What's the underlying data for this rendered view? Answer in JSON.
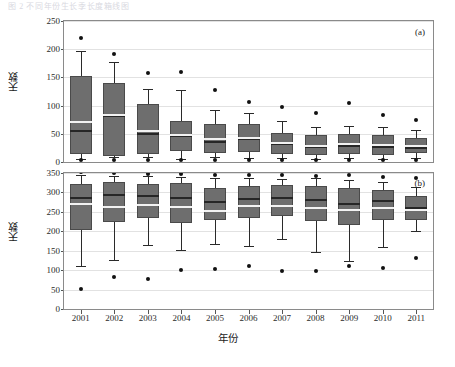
{
  "figure": {
    "caption_strip": "图 2  不同年份生长季长度箱线图",
    "xlabel": "年份",
    "panel_a_tag": "(a)",
    "panel_b_tag": "(b)",
    "box_fill_color": "#6e6e6e",
    "median_color": "#f2f2f2",
    "mean_color": "#262626",
    "outlier_color": "#111111",
    "grid_color": "#e2e2e2",
    "frame_color": "#8a8a8a"
  },
  "chart_data": [
    {
      "type": "box",
      "panel": "(a)",
      "title": "",
      "xlabel": "年份",
      "ylabel": "天数",
      "ylim": [
        0,
        250
      ],
      "yticks": [
        0,
        50,
        100,
        150,
        200,
        250
      ],
      "grid": true,
      "categories": [
        "2001",
        "2002",
        "2003",
        "2004",
        "2005",
        "2006",
        "2007",
        "2008",
        "2009",
        "2010",
        "2011"
      ],
      "boxes": [
        {
          "x": "2001",
          "whisker_low": 6,
          "q1": 14,
          "median": 73,
          "mean": 57,
          "q3": 152,
          "whisker_high": 196,
          "outliers": [
            219,
            4
          ]
        },
        {
          "x": "2002",
          "whisker_low": 8,
          "q1": 11,
          "median": 85,
          "mean": 83,
          "q3": 140,
          "whisker_high": 178,
          "outliers": [
            192,
            3
          ]
        },
        {
          "x": "2003",
          "whisker_low": 9,
          "q1": 14,
          "median": 56,
          "mean": 52,
          "q3": 103,
          "whisker_high": 130,
          "outliers": [
            158,
            4
          ]
        },
        {
          "x": "2004",
          "whisker_low": 6,
          "q1": 19,
          "median": 50,
          "mean": 47,
          "q3": 73,
          "whisker_high": 128,
          "outliers": [
            159,
            3
          ]
        },
        {
          "x": "2005",
          "whisker_low": 8,
          "q1": 16,
          "median": 43,
          "mean": 38,
          "q3": 67,
          "whisker_high": 93,
          "outliers": [
            127,
            4
          ]
        },
        {
          "x": "2006",
          "whisker_low": 7,
          "q1": 17,
          "median": 44,
          "mean": 42,
          "q3": 68,
          "whisker_high": 86,
          "outliers": [
            106,
            3
          ]
        },
        {
          "x": "2007",
          "whisker_low": 7,
          "q1": 15,
          "median": 36,
          "mean": 33,
          "q3": 52,
          "whisker_high": 72,
          "outliers": [
            98,
            4
          ]
        },
        {
          "x": "2008",
          "whisker_low": 6,
          "q1": 13,
          "median": 31,
          "mean": 28,
          "q3": 48,
          "whisker_high": 62,
          "outliers": [
            87,
            3
          ]
        },
        {
          "x": "2009",
          "whisker_low": 7,
          "q1": 14,
          "median": 33,
          "mean": 30,
          "q3": 49,
          "whisker_high": 64,
          "outliers": [
            104,
            4
          ]
        },
        {
          "x": "2010",
          "whisker_low": 6,
          "q1": 13,
          "median": 32,
          "mean": 29,
          "q3": 47,
          "whisker_high": 62,
          "outliers": [
            83,
            3
          ]
        },
        {
          "x": "2011",
          "whisker_low": 7,
          "q1": 16,
          "median": 30,
          "mean": 27,
          "q3": 42,
          "whisker_high": 57,
          "outliers": [
            74,
            4
          ]
        }
      ]
    },
    {
      "type": "box",
      "panel": "(b)",
      "title": "",
      "xlabel": "年份",
      "ylabel": "天数",
      "ylim": [
        0,
        350
      ],
      "yticks": [
        0,
        50,
        100,
        150,
        200,
        250,
        300,
        350
      ],
      "grid": true,
      "categories": [
        "2001",
        "2002",
        "2003",
        "2004",
        "2005",
        "2006",
        "2007",
        "2008",
        "2009",
        "2010",
        "2011"
      ],
      "boxes": [
        {
          "x": "2001",
          "whisker_low": 111,
          "q1": 203,
          "median": 272,
          "mean": 288,
          "q3": 322,
          "whisker_high": 344,
          "outliers": [
            352,
            51
          ]
        },
        {
          "x": "2002",
          "whisker_low": 127,
          "q1": 224,
          "median": 265,
          "mean": 295,
          "q3": 327,
          "whisker_high": 342,
          "outliers": [
            350,
            83
          ]
        },
        {
          "x": "2003",
          "whisker_low": 165,
          "q1": 235,
          "median": 271,
          "mean": 293,
          "q3": 321,
          "whisker_high": 341,
          "outliers": [
            348,
            76
          ]
        },
        {
          "x": "2004",
          "whisker_low": 152,
          "q1": 222,
          "median": 264,
          "mean": 288,
          "q3": 325,
          "whisker_high": 340,
          "outliers": [
            347,
            100
          ]
        },
        {
          "x": "2005",
          "whisker_low": 166,
          "q1": 229,
          "median": 256,
          "mean": 278,
          "q3": 312,
          "whisker_high": 337,
          "outliers": [
            345,
            103
          ]
        },
        {
          "x": "2006",
          "whisker_low": 161,
          "q1": 233,
          "median": 268,
          "mean": 286,
          "q3": 316,
          "whisker_high": 338,
          "outliers": [
            346,
            110
          ]
        },
        {
          "x": "2007",
          "whisker_low": 180,
          "q1": 239,
          "median": 268,
          "mean": 289,
          "q3": 318,
          "whisker_high": 335,
          "outliers": [
            344,
            99
          ]
        },
        {
          "x": "2008",
          "whisker_low": 146,
          "q1": 226,
          "median": 262,
          "mean": 282,
          "q3": 316,
          "whisker_high": 337,
          "outliers": [
            343,
            98
          ]
        },
        {
          "x": "2009",
          "whisker_low": 124,
          "q1": 216,
          "median": 258,
          "mean": 274,
          "q3": 311,
          "whisker_high": 333,
          "outliers": [
            345,
            110
          ]
        },
        {
          "x": "2010",
          "whisker_low": 160,
          "q1": 228,
          "median": 263,
          "mean": 281,
          "q3": 305,
          "whisker_high": 326,
          "outliers": [
            339,
            106
          ]
        },
        {
          "x": "2011",
          "whisker_low": 201,
          "q1": 230,
          "median": 257,
          "mean": 263,
          "q3": 292,
          "whisker_high": 313,
          "outliers": [
            336,
            131
          ]
        }
      ]
    }
  ],
  "axes": {
    "panel_a": {
      "ylabel": "天数",
      "ytick_labels": [
        "0",
        "50",
        "100",
        "150",
        "200",
        "250"
      ]
    },
    "panel_b": {
      "ylabel": "天数",
      "ytick_labels": [
        "0",
        "50",
        "100",
        "150",
        "200",
        "250",
        "300",
        "350"
      ]
    },
    "xtick_labels": [
      "2001",
      "2002",
      "2003",
      "2004",
      "2005",
      "2006",
      "2007",
      "2008",
      "2009",
      "2010",
      "2011"
    ],
    "xlabel": "年份"
  }
}
